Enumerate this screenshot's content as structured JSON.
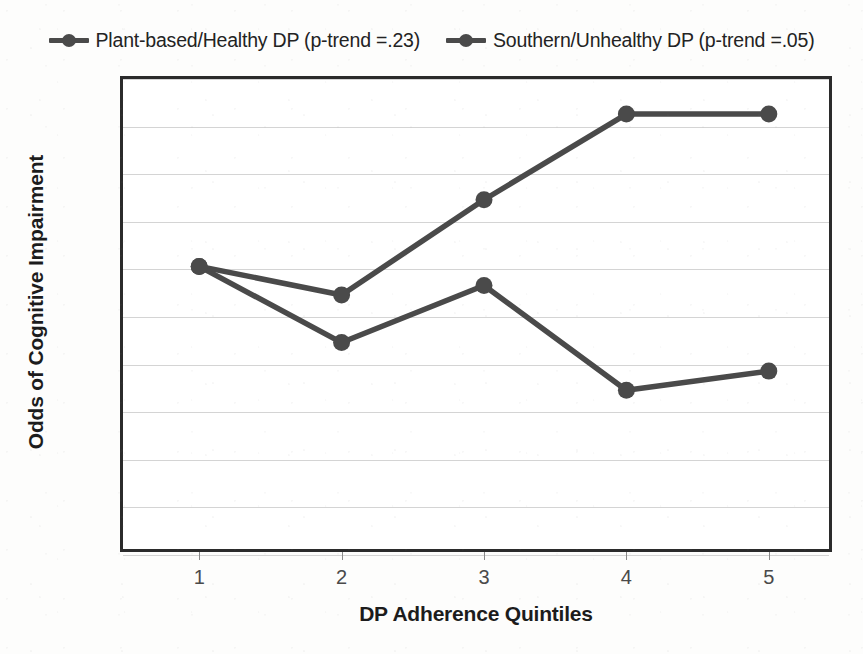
{
  "chart_data": {
    "type": "line",
    "title": "",
    "subtitle": "",
    "xlabel": "DP Adherence Quintiles",
    "ylabel": "Odds of Cognitive Impairment",
    "categories": [
      "1",
      "2",
      "3",
      "4",
      "5"
    ],
    "x": [
      1,
      2,
      3,
      4,
      5
    ],
    "series": [
      {
        "name": "Plant-based/Healthy DP (p-trend =.23)",
        "values": [
          1,
          0.92,
          0.98,
          0.87,
          0.89
        ],
        "color": "#4a4a4a"
      },
      {
        "name": "Southern/Unhealthy DP (p-trend =.05)",
        "values": [
          1,
          0.97,
          1.07,
          1.16,
          1.16
        ],
        "color": "#4a4a4a"
      }
    ],
    "ylim": [
      0.7,
      1.2
    ],
    "ytick_step": 0.05,
    "ytick_labels": [
      "1.2",
      "1.15",
      "1.1",
      "1.05",
      "1",
      "0.95",
      "0.9",
      "0.85",
      "0.8",
      "0.75",
      "0.7"
    ],
    "ytick_values": [
      1.2,
      1.15,
      1.1,
      1.05,
      1,
      0.95,
      0.9,
      0.85,
      0.8,
      0.75,
      0.7
    ],
    "xtick_labels": [
      "1",
      "2",
      "3",
      "4",
      "5"
    ],
    "grid": true,
    "grid_axis": "y",
    "legend_position": "top",
    "legend_entries": [
      "Plant-based/Healthy DP (p-trend =.23)",
      "Southern/Unhealthy DP (p-trend =.05)"
    ],
    "annotations": []
  },
  "legend": {
    "entries": [
      {
        "label": "Plant-based/Healthy DP (p-trend =.23)",
        "marker": "line-circle-marker"
      },
      {
        "label": "Southern/Unhealthy DP (p-trend =.05)",
        "marker": "line-circle-marker"
      }
    ]
  },
  "axes": {
    "y_title": "Odds of Cognitive Impairment",
    "x_title": "DP Adherence Quintiles"
  },
  "colors": {
    "line": "#4a4a4a",
    "marker": "#4a4a4a",
    "axis": "#2b2b2b",
    "grid": "#d4d4d4",
    "text": "#3a3a3a",
    "background": "#fdfdfc"
  }
}
